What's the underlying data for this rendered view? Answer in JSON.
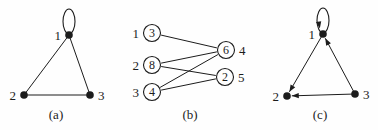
{
  "page": {
    "background_color": "#fefefe",
    "ink_color": "#1c1c1c"
  },
  "graphs": [
    {
      "caption": "(a)",
      "directed": false,
      "node_style": "dot",
      "nodes": [
        {
          "id": "1",
          "label": "1",
          "x": 69,
          "y": 35,
          "label_side": "left",
          "self_loop": true,
          "loop_arrow": false
        },
        {
          "id": "2",
          "label": "2",
          "x": 24,
          "y": 95,
          "label_side": "left",
          "self_loop": false
        },
        {
          "id": "3",
          "label": "3",
          "x": 90,
          "y": 95,
          "label_side": "right",
          "self_loop": false
        }
      ],
      "edges": [
        {
          "from": "1",
          "to": "2",
          "arrow": false
        },
        {
          "from": "1",
          "to": "3",
          "arrow": false
        },
        {
          "from": "2",
          "to": "3",
          "arrow": false
        }
      ]
    },
    {
      "caption": "(b)",
      "directed": false,
      "node_style": "circled",
      "nodes": [
        {
          "id": "L1",
          "label": "1",
          "value": "3",
          "x": 152,
          "y": 33,
          "label_side": "left"
        },
        {
          "id": "L2",
          "label": "2",
          "value": "8",
          "x": 152,
          "y": 65,
          "label_side": "left"
        },
        {
          "id": "L3",
          "label": "3",
          "value": "4",
          "x": 152,
          "y": 92,
          "label_side": "left"
        },
        {
          "id": "R4",
          "label": "4",
          "value": "6",
          "x": 226,
          "y": 50,
          "label_side": "right"
        },
        {
          "id": "R5",
          "label": "5",
          "value": "2",
          "x": 225,
          "y": 77,
          "label_side": "right"
        }
      ],
      "edges": [
        {
          "from": "L1",
          "to": "R4",
          "arrow": false
        },
        {
          "from": "L2",
          "to": "R4",
          "arrow": false
        },
        {
          "from": "L2",
          "to": "R5",
          "arrow": false
        },
        {
          "from": "L3",
          "to": "R4",
          "arrow": false
        },
        {
          "from": "L3",
          "to": "R5",
          "arrow": false
        }
      ]
    },
    {
      "caption": "(c)",
      "directed": true,
      "node_style": "dot",
      "nodes": [
        {
          "id": "1",
          "label": "1",
          "x": 323,
          "y": 34,
          "label_side": "left",
          "self_loop": true,
          "loop_arrow": true
        },
        {
          "id": "2",
          "label": "2",
          "x": 287,
          "y": 96,
          "label_side": "left",
          "self_loop": false
        },
        {
          "id": "3",
          "label": "3",
          "x": 355,
          "y": 94,
          "label_side": "right",
          "self_loop": false
        }
      ],
      "edges": [
        {
          "from": "1",
          "to": "2",
          "arrow": true
        },
        {
          "from": "3",
          "to": "1",
          "arrow": true
        },
        {
          "from": "3",
          "to": "2",
          "arrow": true
        }
      ]
    }
  ]
}
